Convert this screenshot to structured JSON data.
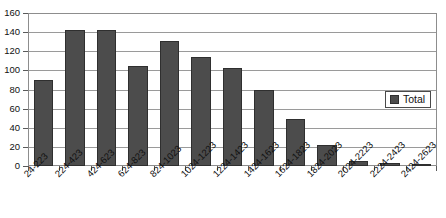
{
  "chart_data": {
    "type": "bar",
    "title": "",
    "subtitle": "",
    "xlabel": "",
    "ylabel": "",
    "ylim": [
      0,
      160
    ],
    "ytick_step": 20,
    "yticks": [
      0,
      20,
      40,
      60,
      80,
      100,
      120,
      140,
      160
    ],
    "ytick_labels": [
      "0",
      "20",
      "40",
      "60",
      "80",
      "100",
      "120",
      "140",
      "160"
    ],
    "grid": true,
    "grid_axis": "y",
    "legend_position": "right-inside",
    "categories": [
      "24-223",
      "224-423",
      "424-623",
      "624-823",
      "824-1023",
      "1024-1223",
      "1224-1423",
      "1424-1623",
      "1624-1823",
      "1824-2023",
      "2024-2223",
      "2224-2423",
      "2424-2623"
    ],
    "series": [
      {
        "name": "Total",
        "color": "#4c4c4c",
        "values": [
          90,
          142,
          142,
          105,
          131,
          114,
          103,
          79,
          49,
          22,
          5,
          3,
          1
        ]
      }
    ]
  },
  "legend": {
    "entries": [
      {
        "label": "Total",
        "color": "#4c4c4c"
      }
    ]
  },
  "colors": {
    "bar_fill": "#4c4c4c",
    "bar_border": "#2f2f2f",
    "gridline": "#9a9a9a",
    "frame": "#8d8d8d",
    "background": "#ffffff",
    "text": "#111111"
  }
}
